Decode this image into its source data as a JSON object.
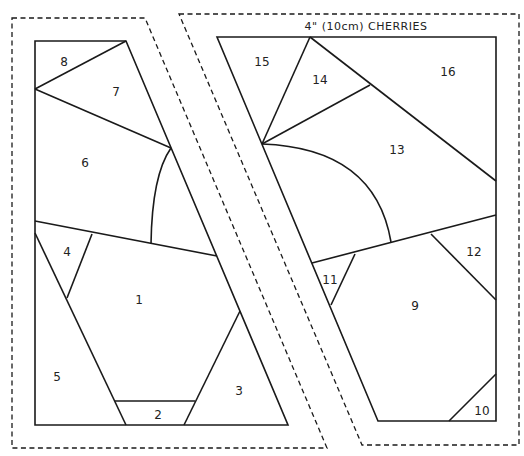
{
  "pattern": {
    "title": "4\" (10cm) CHERRIES",
    "left_section": {
      "pieces": [
        {
          "id": "1",
          "label": "1"
        },
        {
          "id": "2",
          "label": "2"
        },
        {
          "id": "3",
          "label": "3"
        },
        {
          "id": "4",
          "label": "4"
        },
        {
          "id": "5",
          "label": "5"
        },
        {
          "id": "6",
          "label": "6"
        },
        {
          "id": "7",
          "label": "7"
        },
        {
          "id": "8",
          "label": "8"
        }
      ]
    },
    "right_section": {
      "pieces": [
        {
          "id": "9",
          "label": "9"
        },
        {
          "id": "10",
          "label": "10"
        },
        {
          "id": "11",
          "label": "11"
        },
        {
          "id": "12",
          "label": "12"
        },
        {
          "id": "13",
          "label": "13"
        },
        {
          "id": "14",
          "label": "14"
        },
        {
          "id": "15",
          "label": "15"
        },
        {
          "id": "16",
          "label": "16"
        }
      ]
    },
    "colors": {
      "line": "#1a1a1a",
      "background": "#ffffff"
    }
  }
}
